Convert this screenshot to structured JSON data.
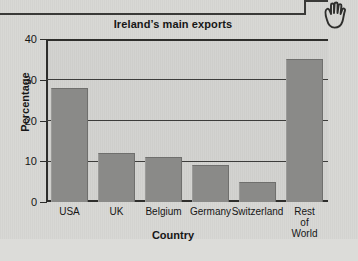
{
  "page": {
    "hand_icon": "hand-pointer-icon"
  },
  "chart_data": {
    "type": "bar",
    "title": "Ireland’s main exports",
    "xlabel": "Country",
    "ylabel": "Percentage",
    "categories": [
      "USA",
      "UK",
      "Belgium",
      "Germany",
      "Switzerland",
      "Rest of\nWorld"
    ],
    "values": [
      28,
      12,
      11,
      9,
      5,
      35
    ],
    "ylim": [
      0,
      40
    ],
    "yticks": [
      0,
      10,
      20,
      30,
      40
    ],
    "ytick_labels": [
      "0",
      "10",
      "20",
      "30",
      "40"
    ],
    "grid": true,
    "legend": false,
    "bar_color": "#8a8a88",
    "plot_background": "#d2d2cf",
    "axis_color": "#2e2e2c"
  }
}
